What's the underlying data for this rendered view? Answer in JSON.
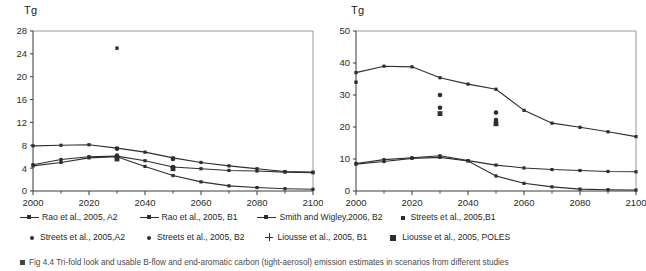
{
  "figure": {
    "caption": "Fig 4.4   Tri-fold look and usable B-flow and end-aromatic carbon (tight-aerosol) emission estimates in scenarios from different studies",
    "caption_visible": "partially-cropped"
  },
  "panels": [
    {
      "id": "left",
      "yaxis_title": "Tg"
    },
    {
      "id": "right",
      "yaxis_title": "Tg"
    }
  ],
  "legend": {
    "rows": [
      [
        {
          "marker": "line",
          "label": "Rao et al., 2005, A2"
        },
        {
          "marker": "line",
          "label": "Rao et al., 2005, B1"
        },
        {
          "marker": "line",
          "label": "Smith and Wigley,2006, B2"
        },
        {
          "marker": "square-small",
          "label": "Streets et al., 2005,B1"
        }
      ],
      [
        {
          "marker": "dot",
          "label": "Streets et al., 2005,A2"
        },
        {
          "marker": "dot",
          "label": "Streets et al., 2005, B2"
        },
        {
          "marker": "plus",
          "label": "Liousse et al., 2005, B1"
        },
        {
          "marker": "square-large",
          "label": "Liousse et al., 2005, POLES"
        }
      ]
    ]
  },
  "chart_data": [
    {
      "type": "line",
      "panel": "left",
      "title": "",
      "xlabel": "",
      "ylabel": "Tg",
      "xlim": [
        2000,
        2100
      ],
      "ylim": [
        0,
        28
      ],
      "yticks": [
        0,
        4,
        8,
        12,
        16,
        20,
        24,
        28
      ],
      "xticks": [
        2000,
        2020,
        2040,
        2060,
        2080,
        2100
      ],
      "grid": false,
      "legend_position": "below-figure",
      "x": [
        2000,
        2010,
        2020,
        2030,
        2040,
        2050,
        2060,
        2070,
        2080,
        2090,
        2100
      ],
      "series": [
        {
          "name": "Rao et al., 2005, A2",
          "marker": "line",
          "values": [
            7.9,
            8.0,
            8.1,
            7.5,
            6.8,
            5.8,
            5.0,
            4.4,
            3.9,
            3.4,
            3.3
          ]
        },
        {
          "name": "Rao et al., 2005, B1",
          "marker": "line",
          "values": [
            4.6,
            5.5,
            6.0,
            6.1,
            5.3,
            4.2,
            3.9,
            3.6,
            3.5,
            3.3,
            3.2
          ]
        },
        {
          "name": "Smith and Wigley,2006, B2",
          "marker": "line",
          "values": [
            4.4,
            5.0,
            5.8,
            6.0,
            4.3,
            2.7,
            1.6,
            0.9,
            0.6,
            0.4,
            0.3
          ]
        }
      ],
      "scatter": [
        {
          "name": "Streets et al., 2005,B1",
          "marker": "square-small",
          "points": [
            [
              2030,
              25.0
            ]
          ]
        },
        {
          "name": "Streets et al., 2005,A2",
          "marker": "dot",
          "points": [
            [
              2030,
              7.4
            ],
            [
              2050,
              5.6
            ]
          ]
        },
        {
          "name": "Streets et al., 2005, B2",
          "marker": "dot",
          "points": [
            [
              2030,
              6.2
            ],
            [
              2050,
              4.2
            ]
          ]
        },
        {
          "name": "Liousse et al., 2005, B1",
          "marker": "plus",
          "points": [
            [
              2030,
              5.9
            ],
            [
              2050,
              4.1
            ]
          ]
        },
        {
          "name": "Liousse et al., 2005, POLES",
          "marker": "square-large",
          "points": [
            [
              2030,
              5.6
            ],
            [
              2050,
              3.9
            ]
          ]
        }
      ]
    },
    {
      "type": "line",
      "panel": "right",
      "title": "",
      "xlabel": "",
      "ylabel": "Tg",
      "xlim": [
        2000,
        2100
      ],
      "ylim": [
        0,
        50
      ],
      "yticks": [
        0,
        10,
        20,
        30,
        40,
        50
      ],
      "xticks": [
        2000,
        2020,
        2040,
        2060,
        2080,
        2100
      ],
      "grid": false,
      "legend_position": "below-figure",
      "x": [
        2000,
        2010,
        2020,
        2030,
        2040,
        2050,
        2060,
        2070,
        2080,
        2090,
        2100
      ],
      "series": [
        {
          "name": "Rao et al., 2005, A2",
          "marker": "line",
          "values": [
            37.0,
            39.0,
            38.8,
            35.4,
            33.4,
            31.8,
            25.2,
            21.2,
            19.9,
            18.5,
            17.0
          ]
        },
        {
          "name": "Rao et al., 2005, B1",
          "marker": "line",
          "values": [
            8.6,
            9.8,
            10.4,
            11.0,
            9.5,
            8.1,
            7.2,
            6.7,
            6.4,
            6.1,
            6.0
          ]
        },
        {
          "name": "Smith and Wigley,2006, B2",
          "marker": "line",
          "values": [
            8.4,
            9.2,
            10.2,
            10.5,
            9.4,
            4.7,
            2.4,
            1.3,
            0.6,
            0.4,
            0.3
          ]
        }
      ],
      "scatter": [
        {
          "name": "Streets et al., 2005,B1",
          "marker": "square-small",
          "points": [
            [
              2000,
              34.0
            ]
          ]
        },
        {
          "name": "Streets et al., 2005,A2",
          "marker": "dot",
          "points": [
            [
              2030,
              30.0
            ],
            [
              2050,
              24.5
            ]
          ]
        },
        {
          "name": "Streets et al., 2005, B2",
          "marker": "dot",
          "points": [
            [
              2030,
              26.0
            ],
            [
              2050,
              22.2
            ]
          ]
        },
        {
          "name": "Liousse et al., 2005, POLES",
          "marker": "square-large",
          "points": [
            [
              2030,
              24.2
            ],
            [
              2050,
              21.0
            ]
          ]
        }
      ]
    }
  ]
}
